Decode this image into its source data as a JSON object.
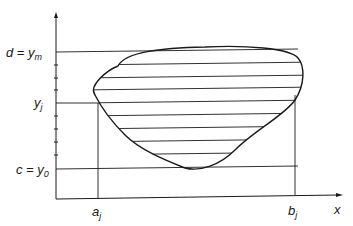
{
  "diagram": {
    "type": "region-with-horizontal-strips",
    "labels": {
      "d_ym": "d = y",
      "d_ym_sub": "m",
      "yj": "y",
      "yj_sub": "j",
      "c_y0": "c = y",
      "c_y0_sub": "0",
      "aj": "a",
      "aj_sub": "j",
      "bj": "b",
      "bj_sub": "j",
      "x_axis": "x"
    },
    "axes": {
      "origin": [
        56,
        199
      ],
      "y_axis_top": 13,
      "x_axis_end": 342
    },
    "levels": {
      "d_y": 52,
      "yj_y": 103,
      "c_y": 169,
      "aj_x": 98,
      "bj_x": 295
    },
    "y_ticks": [
      65,
      78,
      90,
      116,
      129,
      142,
      155
    ],
    "hatch_count": 9,
    "colors": {
      "stroke": "#1a1a1a",
      "background": "#ffffff"
    }
  }
}
